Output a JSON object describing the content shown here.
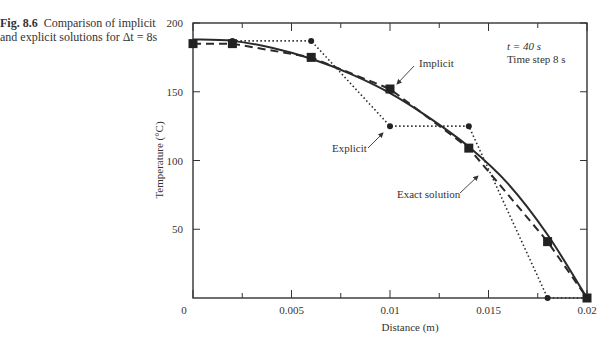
{
  "caption": {
    "fig_label": "Fig. 8.6",
    "text": "Comparison of implicit and explicit solutions for Δt = 8s"
  },
  "annotations": {
    "time": "t = 40 s",
    "step": "Time step 8 s",
    "implicit": "Implicit",
    "explicit": "Explicit",
    "exact": "Exact solution"
  },
  "chart_data": {
    "type": "line",
    "title": "Comparison of implicit and explicit solutions for Δt = 8s",
    "xlabel": "Distance (m)",
    "ylabel": "Temperature (°C)",
    "xlim": [
      0,
      0.02
    ],
    "ylim": [
      0,
      200
    ],
    "xticks": [
      "0",
      "0.005",
      "0.01",
      "0.015",
      "0.02"
    ],
    "yticks": [
      "50",
      "100",
      "150",
      "200"
    ],
    "grid": false,
    "legend": "inline annotations with arrows",
    "series": [
      {
        "name": "Exact solution",
        "style": "solid",
        "x": [
          0,
          0.002,
          0.004,
          0.006,
          0.008,
          0.01,
          0.012,
          0.014,
          0.016,
          0.018,
          0.02
        ],
        "y": [
          188,
          187,
          182,
          174,
          163,
          149,
          131,
          110,
          83,
          46,
          0
        ]
      },
      {
        "name": "Implicit",
        "style": "dashed",
        "marker": "square",
        "x": [
          0,
          0.002,
          0.006,
          0.01,
          0.014,
          0.018,
          0.02
        ],
        "y": [
          185,
          185,
          175,
          152,
          109,
          41,
          0
        ]
      },
      {
        "name": "Explicit",
        "style": "dotted",
        "marker": "circle",
        "x": [
          0.002,
          0.006,
          0.01,
          0.014,
          0.018,
          0.02
        ],
        "y": [
          187,
          187,
          125,
          125,
          0,
          0
        ]
      }
    ],
    "text_annotations": [
      "t = 40 s",
      "Time step 8 s"
    ]
  }
}
